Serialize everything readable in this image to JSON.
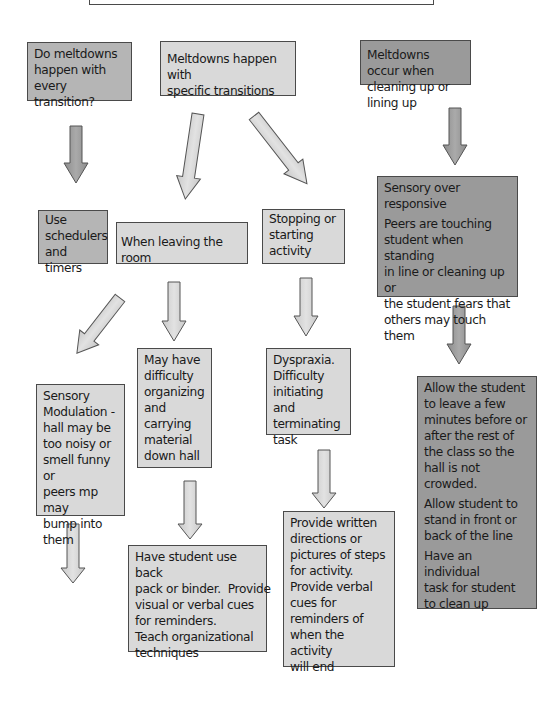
{
  "diagram": {
    "type": "flowchart",
    "colors": {
      "light_fill": "#d9d9d9",
      "mid_fill": "#b5b5b5",
      "dark_fill": "#9a9a9a",
      "border": "#4a4a4a",
      "arrow_light": "#d6d6d6",
      "arrow_dark": "#9c9c9c"
    },
    "top_box": {
      "text": ""
    },
    "row1": {
      "every_transition": [
        "Do meltdowns",
        "happen with every",
        "transition?"
      ],
      "specific_transitions": [
        "Meltdowns happen with",
        "specific transitions"
      ],
      "cleaning_lining": [
        "Meltdowns occur when",
        "cleaning up or lining up"
      ]
    },
    "row2": {
      "schedulers": [
        "Use",
        "schedulers",
        "and timers"
      ],
      "leaving_room": "When leaving the room",
      "stopping_starting": [
        "Stopping or",
        "starting",
        "activity"
      ],
      "sensory_over_responsive": {
        "title": [
          "Sensory over",
          "responsive"
        ],
        "body": [
          "Peers are touching",
          "student when standing",
          "in line or cleaning up or",
          "the student fears that",
          "others may touch them"
        ]
      }
    },
    "row3": {
      "sensory_modulation": [
        "Sensory",
        "Modulation -",
        "hall may be",
        "too noisy or",
        "smell funny or",
        "peers mp may",
        "bump into",
        "them"
      ],
      "organizing": [
        "May have",
        "difficulty",
        "organizing",
        "and",
        "carrying",
        "material",
        "down hall"
      ],
      "dyspraxia": [
        "Dyspraxia.",
        "Difficulty",
        "initiating and",
        "terminating",
        "task"
      ],
      "allow_leave": {
        "p1": [
          "Allow the student",
          "to leave a few",
          "minutes before or",
          "after the rest of",
          "the class so the",
          "hall is not",
          "crowded."
        ],
        "p2": [
          "Allow student to",
          "stand in front or",
          "back of the line"
        ],
        "p3": [
          "Have an individual",
          "task for student",
          "to clean up"
        ]
      }
    },
    "row4": {
      "backpack": [
        "Have student use back",
        "pack or binder.  Provide",
        "visual or verbal cues",
        "for reminders.",
        "Teach organizational",
        "techniques"
      ],
      "written_directions": [
        "Provide written",
        "directions or",
        "pictures of steps",
        "for activity.",
        "Provide verbal",
        "cues for",
        "reminders of",
        "when the activity",
        "will end"
      ]
    }
  }
}
